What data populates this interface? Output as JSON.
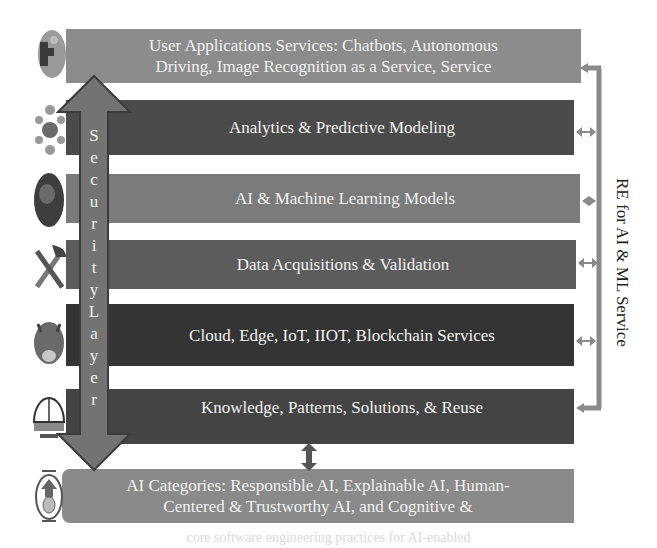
{
  "diagram": {
    "type": "layered-architecture",
    "layers": [
      {
        "id": "user-applications",
        "lines": [
          "User Applications Services: Chatbots, Autonomous",
          "Driving, Image Recognition as a Service, Service"
        ],
        "color": "#8c8c8c",
        "icon": "puzzle-globe-icon"
      },
      {
        "id": "analytics",
        "lines": [
          "Analytics & Predictive Modeling"
        ],
        "color": "#4b4b4b",
        "icon": "network-nodes-icon"
      },
      {
        "id": "ai-ml-models",
        "lines": [
          "AI & Machine Learning Models"
        ],
        "color": "#7b7b7b",
        "icon": "brain-image-icon"
      },
      {
        "id": "data-acquisition",
        "lines": [
          "Data Acquisitions & Validation"
        ],
        "color": "#5c5c5c",
        "icon": "tools-icon"
      },
      {
        "id": "cloud-edge",
        "lines": [
          "Cloud, Edge, IoT, IIOT, Blockchain Services"
        ],
        "color": "#343434",
        "icon": "cloud-globe-icon"
      },
      {
        "id": "knowledge",
        "lines": [
          "Knowledge, Patterns, Solutions, & Reuse"
        ],
        "color": "#444444",
        "icon": "dome-building-icon"
      },
      {
        "id": "ai-categories",
        "lines": [
          "AI Categories: Responsible AI, Explainable AI, Human-",
          "Centered & Trustworthy AI, and Cognitive &"
        ],
        "color": "#8a8a8a",
        "icon": "ai-shield-icon"
      }
    ],
    "security_layer": {
      "label": "SecurityLayer",
      "letters": [
        "S",
        "e",
        "c",
        "u",
        "r",
        "i",
        "t",
        "y",
        "L",
        "a",
        "y",
        "e",
        "r"
      ],
      "color": "#737373"
    },
    "right_connector": {
      "label": "RE for AI & ML Service",
      "color": "#8a8a8a"
    },
    "footer_fragment": "core software engineering practices for AI-enabled"
  }
}
